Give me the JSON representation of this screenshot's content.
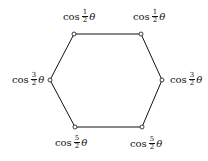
{
  "diagram": {
    "shape": "hexagon",
    "stroke_color": "#111111",
    "vertices": [
      {
        "id": "top-left",
        "x": 74,
        "y": 34,
        "label": {
          "func": "cos",
          "num": "1",
          "den": "2",
          "var": "θ"
        }
      },
      {
        "id": "top-right",
        "x": 141,
        "y": 34,
        "label": {
          "func": "cos",
          "num": "1",
          "den": "2",
          "var": "θ"
        }
      },
      {
        "id": "right",
        "x": 162,
        "y": 80,
        "label": {
          "func": "cos",
          "num": "3",
          "den": "2",
          "var": "θ"
        }
      },
      {
        "id": "bottom-right",
        "x": 142,
        "y": 127,
        "label": {
          "func": "cos",
          "num": "5",
          "den": "2",
          "var": "θ"
        }
      },
      {
        "id": "bottom-left",
        "x": 75,
        "y": 127,
        "label": {
          "func": "cos",
          "num": "5",
          "den": "2",
          "var": "θ"
        }
      },
      {
        "id": "left",
        "x": 50,
        "y": 80,
        "label": {
          "func": "cos",
          "num": "3",
          "den": "2",
          "var": "θ"
        }
      }
    ]
  }
}
